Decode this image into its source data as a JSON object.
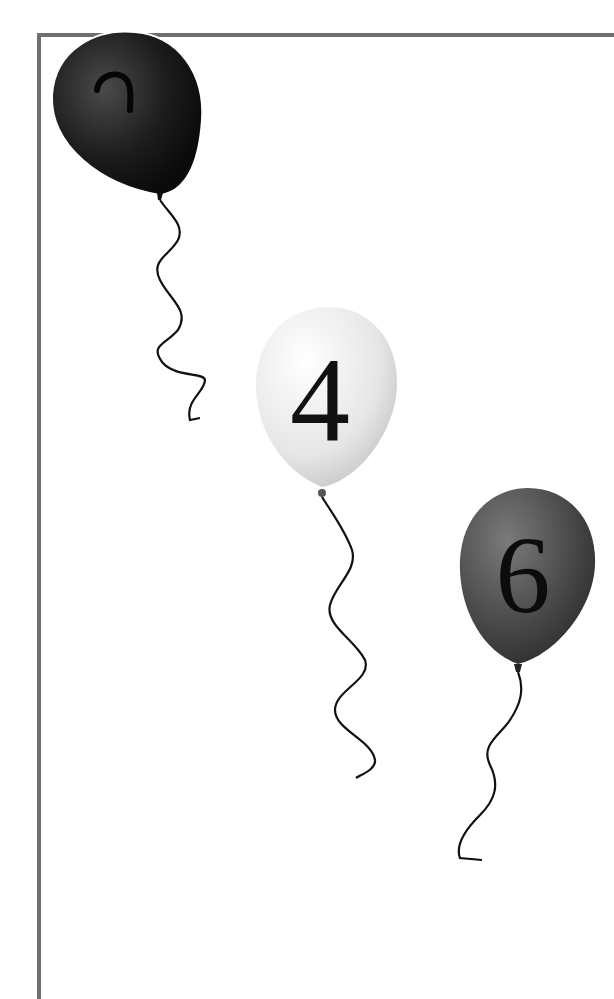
{
  "image": {
    "description": "Three balloons with numbers on strings descending diagonally inside a gray L-shaped frame",
    "frame_color": "#6f6f6f",
    "background": "#ffffff"
  },
  "balloons": [
    {
      "label": "2",
      "color": "#1a1a1a",
      "position": "top-left"
    },
    {
      "label": "4",
      "color": "#e8e8e8",
      "position": "middle"
    },
    {
      "label": "6",
      "color": "#4a4a4a",
      "position": "right"
    }
  ]
}
